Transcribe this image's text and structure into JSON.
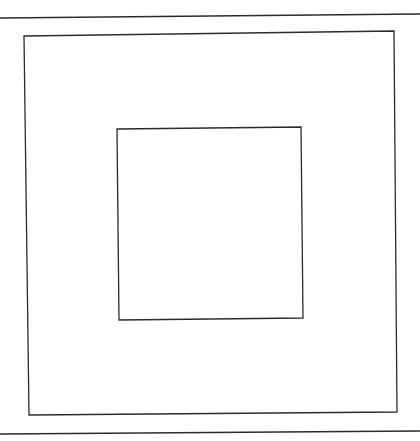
{
  "diagram": {
    "type": "nested-squares",
    "background": "#ffffff",
    "stroke_color": "#2b2b2b",
    "stroke_width": 1.3,
    "top_rule": {
      "x1": 0,
      "y1": 18,
      "x2": 420,
      "y2": 14
    },
    "bottom_rule": {
      "x1": 0,
      "y1": 434,
      "x2": 420,
      "y2": 431
    },
    "outer_square": {
      "points": "24,36 394,31 397,412 29,415"
    },
    "inner_square": {
      "points": "117,129 301,127 303,318 119,320"
    }
  }
}
